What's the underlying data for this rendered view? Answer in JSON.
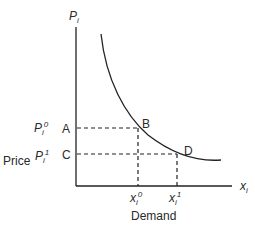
{
  "diagram": {
    "type": "demand-curve",
    "y_axis_label": "P",
    "y_axis_sub": "i",
    "x_axis_label": "x",
    "x_axis_sub": "i",
    "price_label": "Price",
    "demand_label": "Demand",
    "price_levels": [
      {
        "symbol": "P",
        "sub": "i",
        "sup": "0",
        "point_left": "A",
        "point_curve": "B"
      },
      {
        "symbol": "P",
        "sub": "i",
        "sup": "1",
        "point_left": "C",
        "point_curve": "D"
      }
    ],
    "quantity_levels": [
      {
        "symbol": "x",
        "sub": "i",
        "sup": "0"
      },
      {
        "symbol": "x",
        "sub": "i",
        "sup": "1"
      }
    ]
  }
}
